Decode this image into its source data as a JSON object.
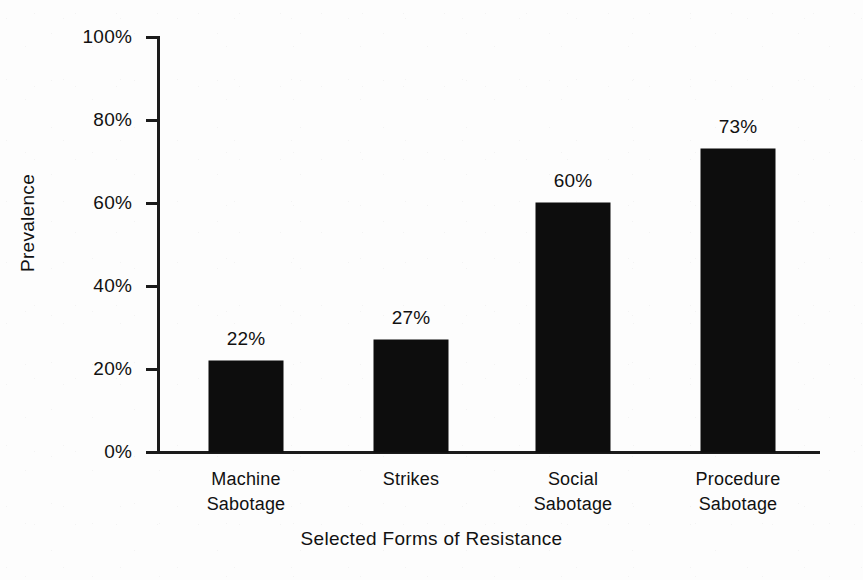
{
  "chart_data": {
    "type": "bar",
    "title": "",
    "categories": [
      "Machine Sabotage",
      "Strikes",
      "Social Sabotage",
      "Procedure Sabotage"
    ],
    "category_lines": [
      [
        "Machine",
        "Sabotage"
      ],
      [
        "Strikes"
      ],
      [
        "Social",
        "Sabotage"
      ],
      [
        "Procedure",
        "Sabotage"
      ]
    ],
    "values": [
      22,
      27,
      60,
      73
    ],
    "data_labels": [
      "22%",
      "27%",
      "60%",
      "73%"
    ],
    "xlabel": "Selected Forms of Resistance",
    "ylabel": "Prevalence",
    "ylim": [
      0,
      100
    ],
    "yticks": [
      0,
      20,
      40,
      60,
      80,
      100
    ],
    "ytick_labels": [
      "0%",
      "20%",
      "40%",
      "60%",
      "80%",
      "100%"
    ],
    "grid": false,
    "legend": false,
    "bar_color": "#0d0d0d",
    "axis_color": "#1b1b1b",
    "background_color": "#fdfdfd"
  }
}
